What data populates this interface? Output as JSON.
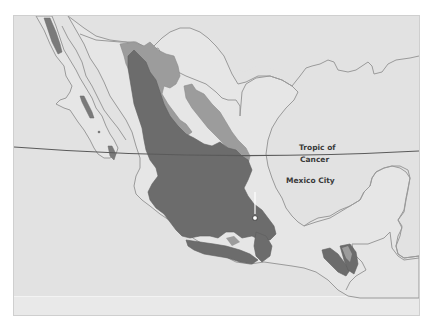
{
  "map": {
    "labels": {
      "tropic_line1": "Tropic of",
      "tropic_line2": "Cancer",
      "city": "Mexico City"
    },
    "legend_colors": {
      "water": "#e2e2e2",
      "land": "#e6e6e6",
      "coastline": "#9a9a9a",
      "highland_medium": "#9c9c9c",
      "highland_high": "#6c6c6c",
      "tropic_line": "#5a5a5a"
    },
    "features": [
      "Baja California",
      "Sierra Madre Occidental",
      "Sierra Madre Oriental",
      "Mexican Plateau",
      "Sierra Madre del Sur",
      "Chiapas Highlands",
      "Yucatan Peninsula",
      "Tropic of Cancer"
    ]
  }
}
